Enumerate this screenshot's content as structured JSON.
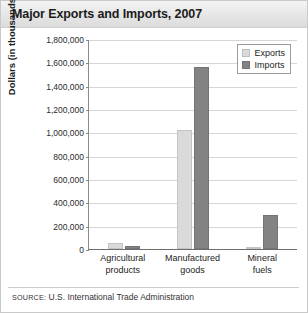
{
  "title": "Major Exports and Imports, 2007",
  "source_prefix": "SOURCE:",
  "source_text": " U.S. International Trade Administration",
  "legend": {
    "position": "top-right",
    "items": [
      {
        "label": "Exports",
        "color": "#dadada"
      },
      {
        "label": "Imports",
        "color": "#838383"
      }
    ]
  },
  "axis": {
    "ylabel": "Dollars (in thousands)",
    "yticks": [
      "1,800,000",
      "1,600,000",
      "1,400,000",
      "1,200,000",
      "1,000,000",
      "800,000",
      "600,000",
      "400,000",
      "200,000",
      "0"
    ]
  },
  "categories": [
    {
      "line1": "Agricultural",
      "line2": "products"
    },
    {
      "line1": "Manufactured",
      "line2": "goods"
    },
    {
      "line1": "Mineral",
      "line2": "fuels"
    }
  ],
  "chart_data": {
    "type": "bar",
    "title": "Major Exports and Imports, 2007",
    "xlabel": "",
    "ylabel": "Dollars (in thousands)",
    "ylim": [
      0,
      1800000
    ],
    "ytick_step": 200000,
    "grid": true,
    "legend_position": "top-right",
    "categories": [
      "Agricultural products",
      "Manufactured goods",
      "Mineral fuels"
    ],
    "series": [
      {
        "name": "Exports",
        "color": "#dadada",
        "values": [
          55000,
          1020000,
          10000
        ]
      },
      {
        "name": "Imports",
        "color": "#838383",
        "values": [
          25000,
          1560000,
          290000
        ]
      }
    ],
    "source": "SOURCE: U.S. International Trade Administration"
  }
}
